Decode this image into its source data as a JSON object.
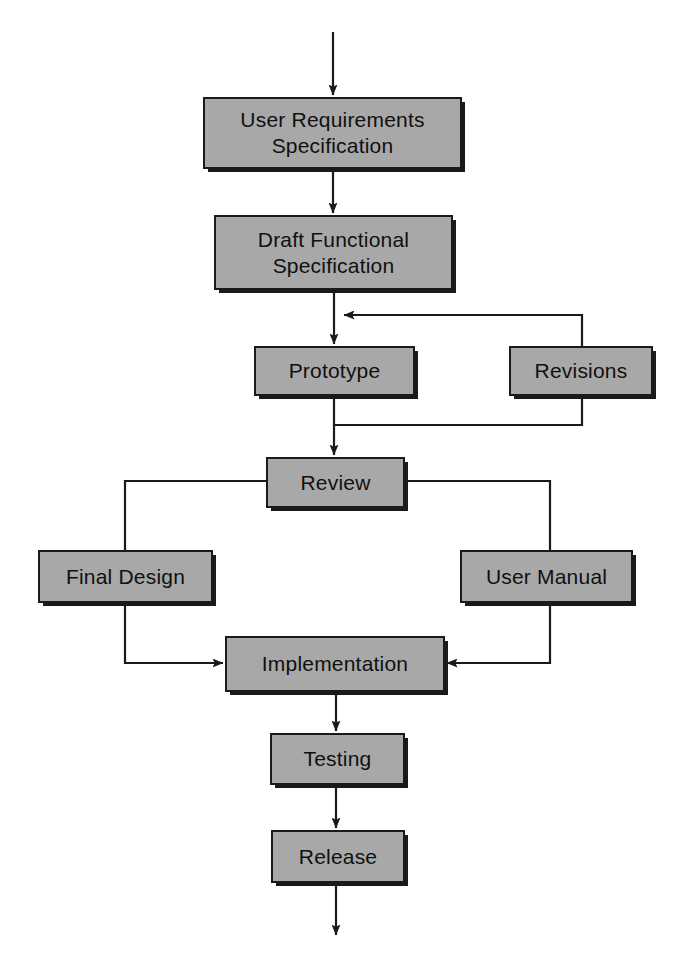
{
  "diagram": {
    "type": "flowchart",
    "orientation": "top-to-bottom",
    "colors": {
      "node_fill": "#a8a8a8",
      "node_border": "#1a1a1a",
      "connector": "#1a1a1a",
      "background": "#ffffff",
      "text": "#101010"
    },
    "nodes": [
      {
        "id": "user-requirements-specification",
        "label": "User Requirements\nSpecification"
      },
      {
        "id": "draft-functional-specification",
        "label": "Draft Functional\nSpecification"
      },
      {
        "id": "prototype",
        "label": "Prototype"
      },
      {
        "id": "revisions",
        "label": "Revisions"
      },
      {
        "id": "review",
        "label": "Review"
      },
      {
        "id": "final-design",
        "label": "Final Design"
      },
      {
        "id": "user-manual",
        "label": "User Manual"
      },
      {
        "id": "implementation",
        "label": "Implementation"
      },
      {
        "id": "testing",
        "label": "Testing"
      },
      {
        "id": "release",
        "label": "Release"
      }
    ],
    "edges": [
      {
        "from": "start",
        "to": "user-requirements-specification",
        "arrow": true
      },
      {
        "from": "user-requirements-specification",
        "to": "draft-functional-specification",
        "arrow": true
      },
      {
        "from": "draft-functional-specification",
        "to": "prototype",
        "arrow": true
      },
      {
        "from": "revisions",
        "to": "draft-functional-specification-to-prototype",
        "arrow": true,
        "note": "feedback loop into main path"
      },
      {
        "from": "prototype",
        "to": "review",
        "arrow": true
      },
      {
        "from": "prototype-to-review",
        "to": "revisions",
        "arrow": false,
        "note": "branch up into Revisions"
      },
      {
        "from": "review",
        "to": "final-design",
        "arrow": false
      },
      {
        "from": "review",
        "to": "user-manual",
        "arrow": false
      },
      {
        "from": "final-design",
        "to": "implementation",
        "arrow": true
      },
      {
        "from": "user-manual",
        "to": "implementation",
        "arrow": true
      },
      {
        "from": "implementation",
        "to": "testing",
        "arrow": true
      },
      {
        "from": "testing",
        "to": "release",
        "arrow": true
      },
      {
        "from": "release",
        "to": "end",
        "arrow": true
      }
    ]
  }
}
